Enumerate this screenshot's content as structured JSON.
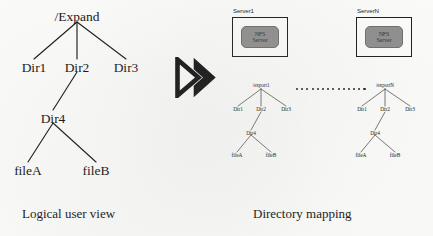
{
  "figure": {
    "background_color": "#fbfbfa",
    "ink_color": "#141414",
    "nfs_chip_color": "#8e8e8e"
  },
  "left_panel": {
    "caption": "Logical user view",
    "tree": {
      "root": "/Expand",
      "children": [
        "Dir1",
        "Dir2",
        "Dir3"
      ],
      "dir2_child": "Dir4",
      "dir4_children": [
        "fileA",
        "fileB"
      ]
    }
  },
  "transition": {
    "icon": "double-chevron-right-arrow"
  },
  "right_panel": {
    "caption": "Directory mapping",
    "ellipsis_dot_count": 14,
    "servers": [
      {
        "label": "Server1",
        "chip_line1": "NFS",
        "chip_line2": "Server",
        "export_root": "/export1",
        "children": [
          "Dir1",
          "Dir2",
          "Dir3"
        ],
        "dir2_child": "Dir4",
        "dir4_children": [
          "fileA",
          "fileB"
        ]
      },
      {
        "label": "ServerN",
        "chip_line1": "NFS",
        "chip_line2": "Server",
        "export_root": "/exportN",
        "children": [
          "Dir1",
          "Dir2",
          "Dir3"
        ],
        "dir2_child": "Dir4",
        "dir4_children": [
          "fileA",
          "fileB"
        ]
      }
    ]
  }
}
